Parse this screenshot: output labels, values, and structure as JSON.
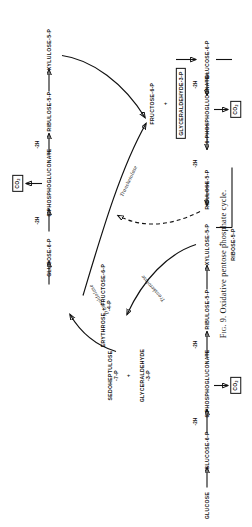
{
  "figure": {
    "caption_prefix": "Fig. 9.",
    "caption_text": "Oxidative pentose phosphate cycle.",
    "caption_full": "Fig. 9. Oxidative pentose phosphate cycle."
  },
  "chart_data": {
    "type": "diagram",
    "title": "Fig. 9. Oxidative pentose phosphate cycle.",
    "diagram_kind": "metabolic-pathway-cycle",
    "orientation": "rotated-90-counterclockwise",
    "metabolites": [
      {
        "id": "glucose",
        "label": "GLUCOSE"
      },
      {
        "id": "glucose-6-p-a",
        "label": "GLUCOSE-6-P"
      },
      {
        "id": "6-phosphogluconate-a",
        "label": "6-PHOSPHOGLUCONATE"
      },
      {
        "id": "ribulose-5-p-a",
        "label": "RIBULOSE-5-P"
      },
      {
        "id": "xylulose-5-p-a",
        "label": "XYLULOSE-5-P"
      },
      {
        "id": "ribose-5-p",
        "label": "RIBOSE-5-P"
      },
      {
        "id": "sedoheptulose-7-p",
        "label": "SEDOHEPTULOSE",
        "sublabel": "-7-P"
      },
      {
        "id": "glyceraldehyde-3-p-cycle",
        "label": "GLYCERALDEHYDE",
        "sublabel": "-3-P"
      },
      {
        "id": "erythrose-4-p-fructose-6-p",
        "label": "ERYTHROSE + FRUCTOSE-6-P",
        "sublabel": "-4-P"
      },
      {
        "id": "glucose-6-p-b",
        "label": "GLUCOSE-6-P"
      },
      {
        "id": "6-phosphogluconate-b",
        "label": "6-PHOSPHOGLUCONATE"
      },
      {
        "id": "ribulose-5-p-b",
        "label": "RIBULOSE-5-P"
      },
      {
        "id": "xylulose-5-p-b",
        "label": "XYLULOSE-5-P"
      },
      {
        "id": "fructose-6-p",
        "label": "FRUCTOSE-6-P"
      },
      {
        "id": "glyceraldehyde-3-p-product",
        "label": "GLYCERALDEHYDE-3-P",
        "boxed": true
      },
      {
        "id": "glucose-6-p-c",
        "label": "GLUCOSE-6-P"
      },
      {
        "id": "6-phosphogluconate-c",
        "label": "6-PHOSPHOGLUCONATE"
      },
      {
        "id": "ribulose-5-p-c",
        "label": "RIBULOSE-5-P"
      }
    ],
    "products": [
      {
        "id": "co2-bottom-left",
        "label": "CO",
        "sub": "2",
        "boxed": true
      },
      {
        "id": "co2-top",
        "label": "CO",
        "sub": "2",
        "boxed": true
      },
      {
        "id": "co2-bottom-right",
        "label": "CO",
        "sub": "2",
        "boxed": true
      }
    ],
    "cofactor_labels": [
      "-2H",
      "-2H",
      "-2H",
      "-2H",
      "-2H",
      "-2H"
    ],
    "enzymes": [
      {
        "id": "transaldolase",
        "label": "Transaldolase"
      },
      {
        "id": "transketolase-1",
        "label": "Transketolase"
      },
      {
        "id": "transketolase-2",
        "label": "Transketolase"
      }
    ],
    "plus_signs": 4,
    "reactions": [
      {
        "from": "GLUCOSE",
        "to": "GLUCOSE-6-P",
        "note": ""
      },
      {
        "from": "GLUCOSE-6-P",
        "to": "6-PHOSPHOGLUCONATE",
        "note": "-2H"
      },
      {
        "from": "6-PHOSPHOGLUCONATE",
        "to": "RIBULOSE-5-P",
        "note": "-2H"
      },
      {
        "from": "6-PHOSPHOGLUCONATE",
        "to": "CO2",
        "note": ""
      },
      {
        "from": "RIBULOSE-5-P",
        "to": "XYLULOSE-5-P",
        "note": ""
      },
      {
        "from": "XYLULOSE-5-P + RIBOSE-5-P",
        "to": "SEDOHEPTULOSE-7-P + GLYCERALDEHYDE-3-P",
        "note": "Transketolase"
      },
      {
        "from": "SEDOHEPTULOSE-7-P + GLYCERALDEHYDE-3-P",
        "to": "ERYTHROSE-4-P + FRUCTOSE-6-P",
        "note": "Transaldolase"
      },
      {
        "from": "ERYTHROSE-4-P + FRUCTOSE-6-P",
        "to": "GLUCOSE-6-P",
        "note": ""
      },
      {
        "from": "GLUCOSE-6-P",
        "to": "6-PHOSPHOGLUCONATE",
        "note": "-2H"
      },
      {
        "from": "6-PHOSPHOGLUCONATE",
        "to": "RIBULOSE-5-P",
        "note": "-2H"
      },
      {
        "from": "6-PHOSPHOGLUCONATE",
        "to": "CO2",
        "note": ""
      },
      {
        "from": "RIBULOSE-5-P",
        "to": "XYLULOSE-5-P",
        "note": ""
      },
      {
        "from": "XYLULOSE-5-P + ERYTHROSE-4-P",
        "to": "FRUCTOSE-6-P + GLYCERALDEHYDE-3-P",
        "note": "Transketolase"
      },
      {
        "from": "FRUCTOSE-6-P",
        "to": "GLUCOSE-6-P",
        "note": ""
      },
      {
        "from": "GLUCOSE-6-P",
        "to": "6-PHOSPHOGLUCONATE",
        "note": "-2H"
      },
      {
        "from": "6-PHOSPHOGLUCONATE",
        "to": "RIBULOSE-5-P",
        "note": "-2H"
      },
      {
        "from": "6-PHOSPHOGLUCONATE",
        "to": "CO2",
        "note": ""
      },
      {
        "from": "RIBULOSE-5-P",
        "to": "RIBOSE-5-P",
        "note": "dashed return"
      }
    ]
  },
  "nodes": {
    "glucose": "GLUCOSE",
    "glucose_6_p_a": "GLUCOSE-6-P",
    "phosphogluconate_a": "6-PHOSPHOGLUCONATE",
    "ribulose_5_p_a": "RIBULOSE-5-P",
    "xylulose_5_p_a": "XYLULOSE-5-P",
    "ribose_5_p": "RIBOSE-5-P",
    "sedoheptulose": "SEDOHEPTULOSE",
    "sedoheptulose_sub": "-7-P",
    "glyceraldehyde_cycle": "GLYCERALDEHYDE",
    "glyceraldehyde_cycle_sub": "-3-P",
    "erythrose_fructose": "ERYTHROSE + FRUCTOSE-6-P",
    "erythrose_sub": "-4-P",
    "glucose_6_p_b": "GLUCOSE-6-P",
    "phosphogluconate_b": "6-PHOSPHOGLUCONATE",
    "ribulose_5_p_b": "RIBULOSE-5-P",
    "xylulose_5_p_b": "XYLULOSE-5-P",
    "fructose_6_p": "FRUCTOSE-6-P",
    "glyceraldehyde_product": "GLYCERALDEHYDE-3-P",
    "glucose_6_p_c": "GLUCOSE-6-P",
    "phosphogluconate_c": "6-PHOSPHOGLUCONATE",
    "ribulose_5_p_c": "RIBULOSE-5-P",
    "plus": "+"
  },
  "co2": {
    "label": "CO",
    "sub": "2"
  },
  "cofactor": {
    "dehydrogenation": "-2H"
  },
  "enzymes": {
    "transaldolase": "Transaldolase",
    "transketolase_1": "Transketolase",
    "transketolase_2": "Transketolase"
  }
}
